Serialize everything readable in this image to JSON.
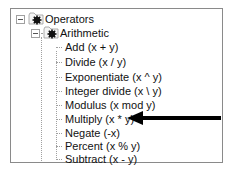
{
  "tree": {
    "root": {
      "label": "Operators",
      "expanded": true,
      "icon": "folder-gear-icon"
    },
    "group": {
      "label": "Arithmetic",
      "expanded": true,
      "icon": "folder-gear-icon"
    },
    "items": [
      {
        "label": "Add (x + y)"
      },
      {
        "label": "Divide (x / y)"
      },
      {
        "label": "Exponentiate (x ^ y)"
      },
      {
        "label": "Integer divide (x \\ y)"
      },
      {
        "label": "Modulus (x mod y)"
      },
      {
        "label": "Multiply (x * y)"
      },
      {
        "label": "Negate (-x)"
      },
      {
        "label": "Percent (x % y)"
      },
      {
        "label": "Subtract (x - y)"
      }
    ]
  },
  "annotation": {
    "type": "arrow",
    "points_to": "Multiply (x * y)",
    "color": "#000000"
  }
}
